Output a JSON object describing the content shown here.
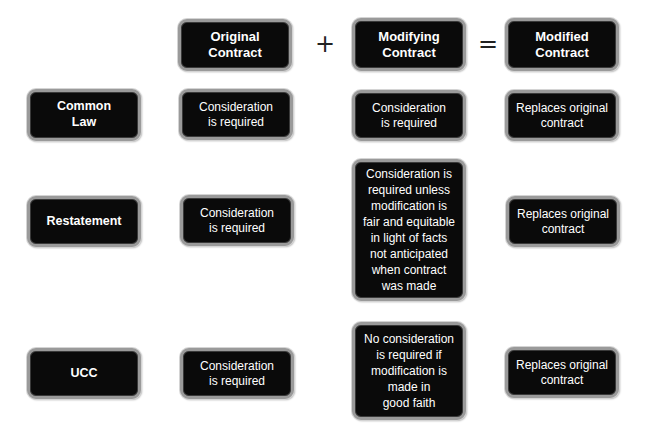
{
  "diagram": {
    "columns": [
      {
        "id": "original",
        "label": "Original\nContract"
      },
      {
        "id": "modifying",
        "label": "Modifying\nContract"
      },
      {
        "id": "modified",
        "label": "Modified\nContract"
      }
    ],
    "operators": {
      "plus": "+",
      "equals": "="
    },
    "rows": [
      {
        "label": "Common\nLaw",
        "original": "Consideration\nis required",
        "modifying": "Consideration\nis required",
        "modified": "Replaces original\ncontract"
      },
      {
        "label": "Restatement",
        "original": "Consideration\nis required",
        "modifying": "Consideration is\nrequired unless\nmodification is\nfair and equitable\nin light of facts\nnot anticipated\nwhen contract\nwas made",
        "modified": "Replaces original\ncontract"
      },
      {
        "label": "UCC",
        "original": "Consideration\nis required",
        "modifying": "No consideration\nis required if\nmodification is\nmade in\ngood faith",
        "modified": "Replaces original\ncontract"
      }
    ],
    "colors": {
      "box_fill": "#0a0a0a",
      "box_text": "#ffffff",
      "box_border": "#9a9a9a",
      "background": "#ffffff",
      "operator": "#222222"
    }
  }
}
